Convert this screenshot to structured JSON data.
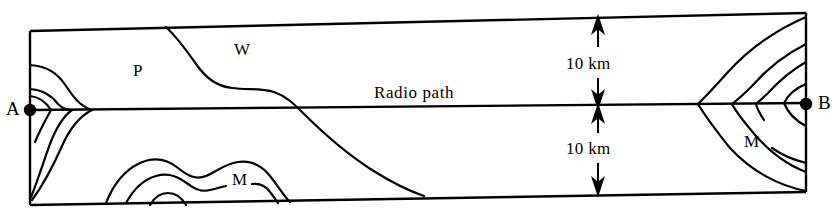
{
  "figure": {
    "background_color": "#ffffff",
    "line_color": "#000000",
    "width": 839,
    "height": 212
  },
  "terminals": {
    "left": {
      "label": "A",
      "marker": "filled-dot"
    },
    "right": {
      "label": "B",
      "marker": "filled-dot"
    }
  },
  "path": {
    "label": "Radio path"
  },
  "dimensions": [
    {
      "id": "upper",
      "label": "10 km",
      "arrow": "double-headed-vertical"
    },
    {
      "id": "lower",
      "label": "10 km",
      "arrow": "double-headed-vertical"
    }
  ],
  "regions": [
    {
      "label": "P",
      "description": "left upper contour region"
    },
    {
      "label": "W",
      "description": "upper central region"
    },
    {
      "label": "M",
      "description": "lower left nested contour region"
    },
    {
      "label": "M",
      "description": "right nested contour region near terminal B"
    }
  ]
}
